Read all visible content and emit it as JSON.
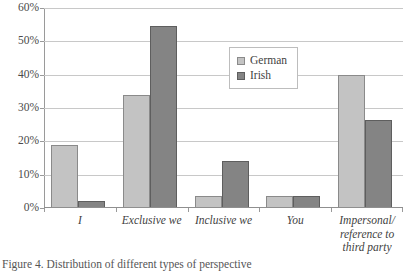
{
  "caption": "Figure 4. Distribution of different types of perspective",
  "legend": {
    "position": "upper-center-right",
    "entries": [
      {
        "label": "German",
        "color": "#c3c3c3"
      },
      {
        "label": "Irish",
        "color": "#848484"
      }
    ]
  },
  "axis": {
    "y_ticks": [
      "0%",
      "10%",
      "20%",
      "30%",
      "40%",
      "50%",
      "60%"
    ]
  },
  "xlabel_lines": {
    "i": [
      "I"
    ],
    "exclusive_we": [
      "Exclusive we"
    ],
    "inclusive_we": [
      "Inclusive we"
    ],
    "you": [
      "You"
    ],
    "impersonal": [
      "Impersonal/",
      "reference to",
      "third party"
    ]
  },
  "chart_data": {
    "type": "bar",
    "title": "",
    "subtitle": "",
    "xlabel": "",
    "ylabel": "",
    "ylim": [
      0,
      60
    ],
    "ytick_step": 10,
    "ytick_values": [
      0,
      10,
      20,
      30,
      40,
      50,
      60
    ],
    "ytick_labels": [
      "0%",
      "10%",
      "20%",
      "30%",
      "40%",
      "50%",
      "60%"
    ],
    "grid": true,
    "grid_axis": "y",
    "legend_position": "upper center right",
    "categories": [
      "I",
      "Exclusive we",
      "Inclusive we",
      "You",
      "Impersonal/reference to third party"
    ],
    "series": [
      {
        "name": "German",
        "color": "#c3c3c3",
        "values": [
          19,
          34,
          3.5,
          3.5,
          40
        ]
      },
      {
        "name": "Irish",
        "color": "#848484",
        "values": [
          2,
          54.5,
          14,
          3.5,
          26.5
        ]
      }
    ]
  }
}
